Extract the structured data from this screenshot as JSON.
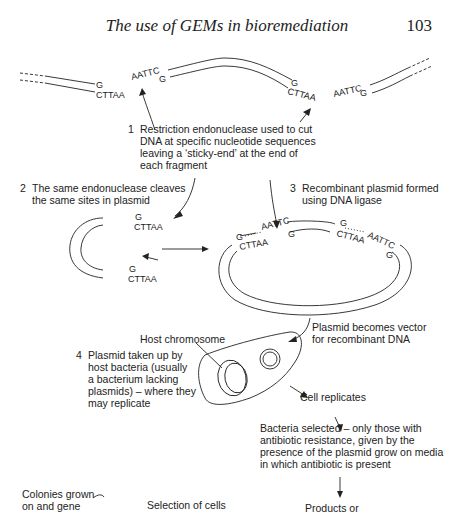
{
  "page": {
    "running_head": "The use of GEMs in bioremediation",
    "page_number": "103"
  },
  "figure": {
    "sequences": {
      "g": "G",
      "cttaa": "CTTAA",
      "aattc": "AATTC"
    },
    "steps": [
      {
        "number": "1",
        "lines": [
          "Restriction endonuclease used to cut",
          "DNA at specific nucleotide sequences",
          "leaving a ‘sticky-end’ at the end of",
          "each fragment"
        ]
      },
      {
        "number": "2",
        "lines": [
          "The same endonuclease cleaves",
          "the same sites in plasmid"
        ]
      },
      {
        "number": "3",
        "lines": [
          "Recombinant plasmid formed",
          "using DNA ligase"
        ]
      },
      {
        "number": "4",
        "lines": [
          "Plasmid taken up by",
          "host bacteria (usually",
          "a bacterium lacking",
          "plasmids) – where they",
          "may replicate"
        ]
      }
    ],
    "labels": {
      "host_chromosome": "Host chromosome",
      "plasmid_vector": [
        "Plasmid becomes vector",
        "for recombinant DNA"
      ],
      "cell_replicates": "Cell replicates",
      "bacteria_selected": [
        "Bacteria selected – only those with",
        "antibiotic resistance, given by the",
        "presence of the plasmid grow on media",
        "in which antibiotic is present"
      ],
      "colonies": [
        "Colonies grown",
        "on and gene"
      ],
      "selection": "Selection of cells",
      "products": "Products or"
    }
  }
}
